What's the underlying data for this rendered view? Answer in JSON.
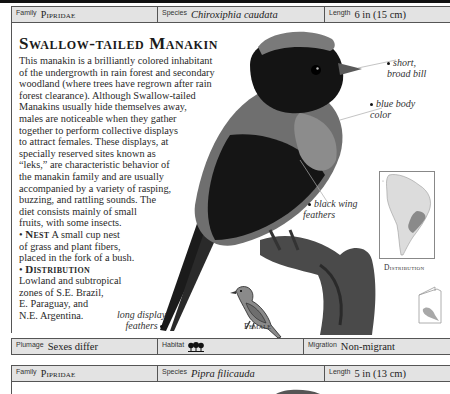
{
  "entry1": {
    "family_label": "Family",
    "family_value": "Pipridae",
    "species_label": "Species",
    "species_value": "Chiroxiphia caudata",
    "length_label": "Length",
    "length_value": "6 in (15 cm)",
    "title": "Swallow-tailed Manakin",
    "body_lines": [
      "This manakin is a brilliantly colored inhabitant",
      "of the undergrowth in rain forest and secondary",
      "woodland (where trees have regrown after rain",
      "forest clearance). Although Swallow-tailed",
      "Manakins usually hide themselves away,",
      "males are noticeable when they gather",
      "together to perform collective displays",
      "to attract females. These displays, at",
      "specially reserved sites known as",
      "“leks,” are characteristic behavior of",
      "the manakin family and are usually",
      "accompanied by a variety of rasping,",
      "buzzing, and rattling sounds. The",
      "diet consists mainly of small",
      "fruits, with some insects."
    ],
    "nest_heading": "Nest",
    "nest_lines": [
      "A small cup nest",
      "of grass and plant fibers,",
      "placed in the fork of a bush."
    ],
    "distribution_heading": "Distribution",
    "distribution_lines": [
      "Lowland and subtropical",
      "zones of S.E. Brazil,",
      "E. Paraguay, and",
      "N.E. Argentina."
    ],
    "annotations": {
      "bill": [
        "short,",
        "broad bill"
      ],
      "body": [
        "blue body",
        "color"
      ],
      "wing": [
        "black wing",
        "feathers"
      ],
      "tail": [
        "long display",
        "feathers"
      ]
    },
    "female_caption": "Female",
    "map_caption": "Distribution",
    "plumage_label": "Plumage",
    "plumage_value": "Sexes differ",
    "habitat_label": "Habitat",
    "habitat_icon": "forest-trees-icon",
    "migration_label": "Migration",
    "migration_value": "Non-migrant"
  },
  "entry2": {
    "family_label": "Family",
    "family_value": "Pipridae",
    "species_label": "Species",
    "species_value": "Pipra filicauda",
    "length_label": "Length",
    "length_value": "5 in (13 cm)"
  },
  "colors": {
    "bar_bg": "#e3e3e3",
    "rule": "#555555",
    "text": "#1a1a1a",
    "range": "#8a8a8a"
  }
}
